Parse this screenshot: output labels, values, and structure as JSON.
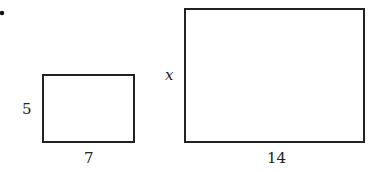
{
  "figure": {
    "bullet": "•",
    "small_rectangle": {
      "height_label": "5",
      "width_label": "7"
    },
    "large_rectangle": {
      "height_label": "x",
      "width_label": "14"
    },
    "colors": {
      "stroke": "#222222",
      "background": "#ffffff"
    }
  }
}
